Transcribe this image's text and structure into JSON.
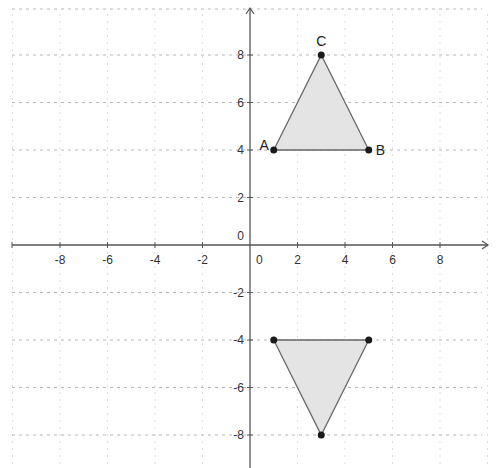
{
  "diagram": {
    "type": "coordinate-plane",
    "colors": {
      "background": "#ffffff",
      "axis": "#555555",
      "grid_h": "#b8b8b8",
      "grid_v": "#dedede",
      "triangle_fill": "#e4e4e4",
      "triangle_stroke": "#666666",
      "point": "#1a1a1a",
      "text": "#333333"
    },
    "x_axis": {
      "min": -10,
      "max": 10,
      "ticks": [
        -8,
        -6,
        -4,
        -2,
        0,
        2,
        4,
        6,
        8
      ],
      "tick_labels": [
        "-8",
        "-6",
        "-4",
        "-2",
        "0",
        "2",
        "4",
        "6",
        "8"
      ]
    },
    "y_axis": {
      "min": -9,
      "max": 10,
      "ticks": [
        8,
        6,
        4,
        2,
        0,
        -2,
        -4,
        -6,
        -8
      ],
      "tick_labels": [
        "8",
        "6",
        "4",
        "2",
        "0",
        "-2",
        "-4",
        "-6",
        "-8"
      ]
    },
    "origin_labels": {
      "x_zero": "0",
      "y_zero": "0"
    },
    "triangles": [
      {
        "name": "ABC",
        "vertices": [
          {
            "label": "A",
            "x": 1,
            "y": 4
          },
          {
            "label": "B",
            "x": 5,
            "y": 4
          },
          {
            "label": "C",
            "x": 3,
            "y": 8
          }
        ]
      },
      {
        "name": "reflection",
        "vertices": [
          {
            "label": "",
            "x": 1,
            "y": -4
          },
          {
            "label": "",
            "x": 5,
            "y": -4
          },
          {
            "label": "",
            "x": 3,
            "y": -8
          }
        ]
      }
    ]
  }
}
